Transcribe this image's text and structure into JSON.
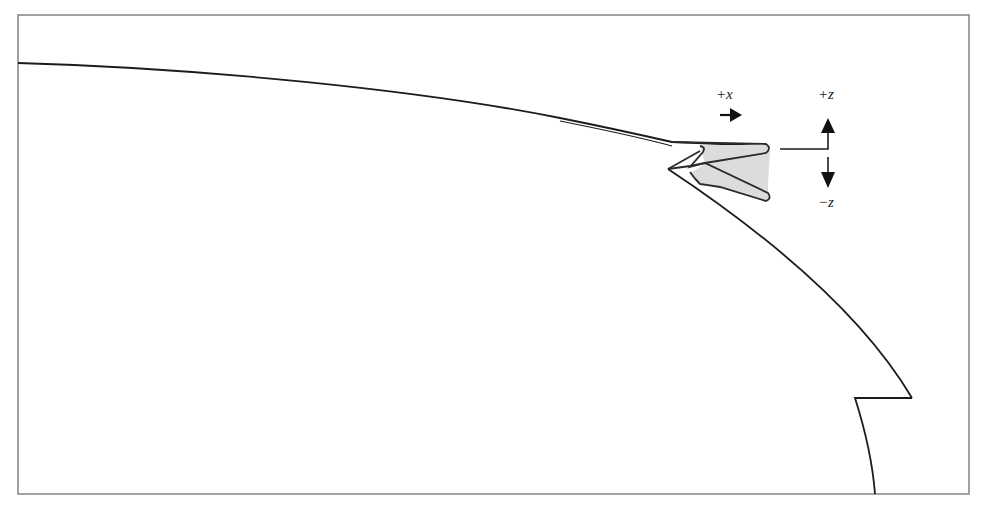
{
  "figure": {
    "type": "cross-section diagram",
    "colors": {
      "frame": "#8a8a8a",
      "line": "#1c1c1c",
      "blade_fill": "#dcdcdc",
      "arrow": "#111111"
    },
    "labels": {
      "plus_x": "+x",
      "plus_z": "+z",
      "minus_z": "−z"
    },
    "arrows": [
      {
        "name": "plus-x-arrow",
        "direction": "right"
      },
      {
        "name": "plus-z-arrow",
        "direction": "up"
      },
      {
        "name": "minus-z-arrow",
        "direction": "down"
      }
    ]
  }
}
